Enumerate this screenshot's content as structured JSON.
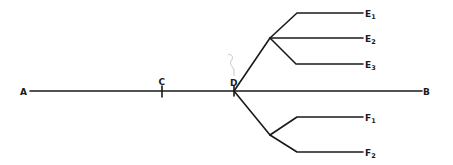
{
  "diagram": {
    "type": "branching line diagram",
    "main_line": {
      "start_label": "A",
      "end_label": "B"
    },
    "points": [
      {
        "id": "C",
        "label": "C",
        "marker": "tick"
      },
      {
        "id": "D",
        "label": "D",
        "marker": "branch-point"
      }
    ],
    "branches": {
      "upper": {
        "origin": "D",
        "ends": [
          {
            "letter": "E",
            "sub": "1"
          },
          {
            "letter": "E",
            "sub": "2"
          },
          {
            "letter": "E",
            "sub": "3"
          }
        ]
      },
      "lower": {
        "origin": "D",
        "ends": [
          {
            "letter": "F",
            "sub": "1"
          },
          {
            "letter": "F",
            "sub": "2"
          }
        ]
      }
    },
    "colors": {
      "ink": "#1a1a1a",
      "annotation": "#b8b8b8",
      "background": "#ffffff"
    }
  }
}
